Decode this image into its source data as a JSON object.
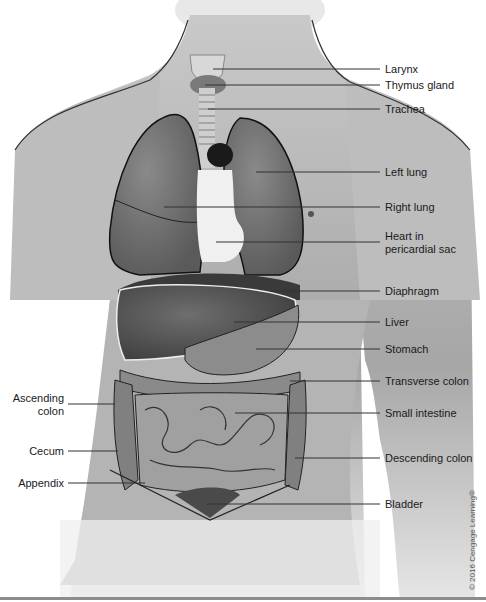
{
  "diagram": {
    "labels_right": [
      {
        "id": "larynx",
        "text": "Larynx"
      },
      {
        "id": "thymus-gland",
        "text": "Thymus gland"
      },
      {
        "id": "trachea",
        "text": "Trachea"
      },
      {
        "id": "left-lung",
        "text": "Left lung"
      },
      {
        "id": "right-lung",
        "text": "Right lung"
      },
      {
        "id": "heart",
        "text": "Heart in",
        "text2": "pericardial sac"
      },
      {
        "id": "diaphragm",
        "text": "Diaphragm"
      },
      {
        "id": "liver",
        "text": "Liver"
      },
      {
        "id": "stomach",
        "text": "Stomach"
      },
      {
        "id": "transverse-colon",
        "text": "Transverse colon"
      },
      {
        "id": "small-intestine",
        "text": "Small intestine"
      },
      {
        "id": "descending-colon",
        "text": "Descending colon"
      },
      {
        "id": "bladder",
        "text": "Bladder"
      }
    ],
    "labels_left": [
      {
        "id": "ascending-colon",
        "text": "Ascending",
        "text2": "colon"
      },
      {
        "id": "cecum",
        "text": "Cecum"
      },
      {
        "id": "appendix",
        "text": "Appendix"
      }
    ],
    "copyright": "© 2016 Cengage Learning®"
  }
}
